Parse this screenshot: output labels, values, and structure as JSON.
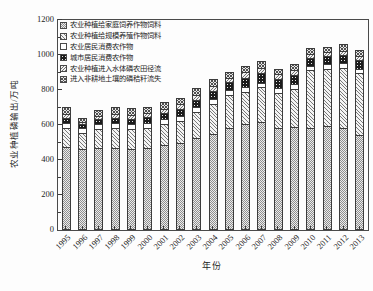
{
  "figure": {
    "background": "#fdfdfd",
    "axis_color": "#4a4a4a",
    "text_color": "#1e1e1e"
  },
  "chart_data": {
    "type": "bar",
    "stacked": true,
    "title": "",
    "xlabel": "年份",
    "ylabel": "农业种植磷输出/万吨",
    "ylim": [
      0,
      1200
    ],
    "yticks": [
      0,
      200,
      400,
      600,
      800,
      1000,
      1200
    ],
    "minor_ytick_interval": 100,
    "grid": false,
    "legend_position": "top-left-inside",
    "categories": [
      "1995",
      "1996",
      "1997",
      "1998",
      "1999",
      "2000",
      "2001",
      "2002",
      "2003",
      "2004",
      "2005",
      "2006",
      "2007",
      "2008",
      "2009",
      "2010",
      "2011",
      "2012",
      "2013"
    ],
    "series": [
      {
        "name": "农业种植给家庭饲养作物饲料",
        "pattern": "dense-dots",
        "values": [
          468,
          455,
          462,
          465,
          455,
          463,
          480,
          490,
          520,
          545,
          575,
          600,
          610,
          575,
          585,
          577,
          589,
          580,
          540
        ]
      },
      {
        "name": "农业种植给规模养殖作物饲料",
        "pattern": "diagonal-hatch",
        "values": [
          109,
          92,
          112,
          112,
          115,
          115,
          120,
          130,
          150,
          170,
          190,
          185,
          200,
          205,
          215,
          331,
          325,
          340,
          350
        ]
      },
      {
        "name": "农业居民消费农作物",
        "pattern": "white",
        "values": [
          30,
          28,
          28,
          29,
          28,
          28,
          28,
          27,
          27,
          28,
          27,
          28,
          27,
          26,
          26,
          26,
          28,
          28,
          27
        ]
      },
      {
        "name": "城市居民消费农作物",
        "pattern": "solid-dark",
        "values": [
          28,
          25,
          28,
          30,
          32,
          34,
          36,
          40,
          42,
          45,
          48,
          52,
          55,
          50,
          55,
          45,
          46,
          48,
          48
        ]
      },
      {
        "name": "农业种植进入水体磷农田径流",
        "pattern": "diagonal-hatch-2",
        "values": [
          25,
          12,
          18,
          22,
          23,
          23,
          24,
          25,
          26,
          28,
          25,
          30,
          30,
          28,
          30,
          23,
          22,
          24,
          23
        ]
      },
      {
        "name": "进入非耕地土壤的磷秸秆流失",
        "pattern": "crosshatch",
        "values": [
          35,
          20,
          32,
          37,
          37,
          37,
          37,
          38,
          40,
          44,
          30,
          35,
          38,
          31,
          34,
          33,
          32,
          35,
          34
        ]
      }
    ],
    "totals": [
      695,
      632,
      680,
      695,
      690,
      700,
      725,
      750,
      805,
      860,
      895,
      930,
      960,
      915,
      945,
      1035,
      1042,
      1055,
      1022
    ]
  }
}
